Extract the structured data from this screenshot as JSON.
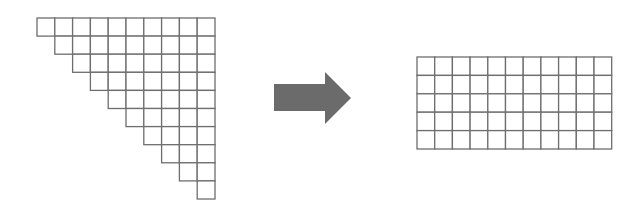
{
  "diagram": {
    "colors": {
      "background": "#ffffff",
      "grid_stroke": "#6e6e6e",
      "arrow_fill": "#6b6b6b"
    },
    "triangle": {
      "shape": "right-aligned staircase",
      "rows": 10,
      "top_row_cells": 10,
      "bottom_row_cells": 1,
      "cell_counts_per_row": [
        10,
        9,
        8,
        7,
        6,
        5,
        4,
        3,
        2,
        1
      ],
      "total_cells": 55,
      "origin_x": 37,
      "origin_y": 18,
      "cell_w": 17.8,
      "cell_h": 18.1
    },
    "arrow": {
      "direction": "right",
      "shaft": {
        "x": 274,
        "y": 84,
        "w": 51,
        "h": 27
      },
      "head": {
        "x1": 325,
        "y_top": 72,
        "y_bottom": 124,
        "tip_x": 351,
        "tip_y": 98
      }
    },
    "rectangle": {
      "columns": 11,
      "rows": 5,
      "total_cells": 55,
      "origin_x": 417,
      "origin_y": 57,
      "cell_w": 17.7,
      "cell_h": 18.4
    }
  }
}
